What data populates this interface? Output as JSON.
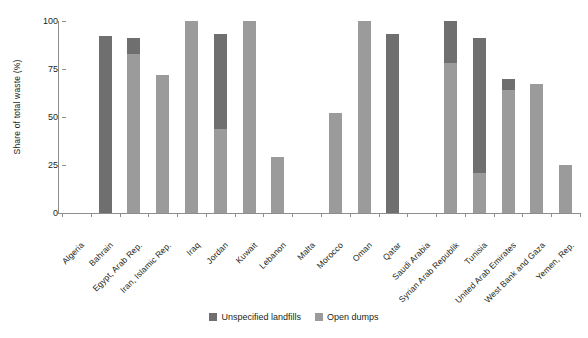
{
  "chart_data": {
    "type": "bar",
    "title": "",
    "xlabel": "",
    "ylabel": "Share of total waste (%)",
    "ylim": [
      0,
      100
    ],
    "yticks": [
      0,
      25,
      50,
      75,
      100
    ],
    "ytick_labels": [
      "0",
      "25",
      "50",
      "75",
      "100"
    ],
    "grid": false,
    "stacked": true,
    "legend_position": "bottom-center",
    "categories": [
      "Algeria",
      "Bahrain",
      "Egypt, Arab Rep.",
      "Iran, Islamic Rep.",
      "Iraq",
      "Jordan",
      "Kuwait",
      "Lebanon",
      "Malta",
      "Morocco",
      "Oman",
      "Qatar",
      "Saudi Arabia",
      "Syrian Arab Republik",
      "Tunisia",
      "United Arab Emirates",
      "West Bank and Gaza",
      "Yemen, Rep."
    ],
    "series": [
      {
        "name": "Unspecified landfills",
        "color": "#6f6f6f",
        "values": [
          0,
          92,
          8,
          0,
          0,
          49,
          0,
          0,
          0,
          0,
          0,
          93,
          0,
          22,
          70,
          6,
          0,
          0
        ]
      },
      {
        "name": "Open dumps",
        "color": "#9b9b9b",
        "values": [
          0,
          0,
          83,
          72,
          100,
          44,
          100,
          29,
          0,
          52,
          100,
          0,
          0,
          78,
          21,
          64,
          67,
          25
        ]
      }
    ],
    "totals": [
      0,
      92,
      91,
      72,
      100,
      93,
      100,
      29,
      0,
      52,
      100,
      93,
      0,
      100,
      91,
      70,
      67,
      25
    ]
  },
  "legend": {
    "items": [
      {
        "label": "Unspecified landfills",
        "swatch": "dark"
      },
      {
        "label": "Open dumps",
        "swatch": "light"
      }
    ]
  }
}
